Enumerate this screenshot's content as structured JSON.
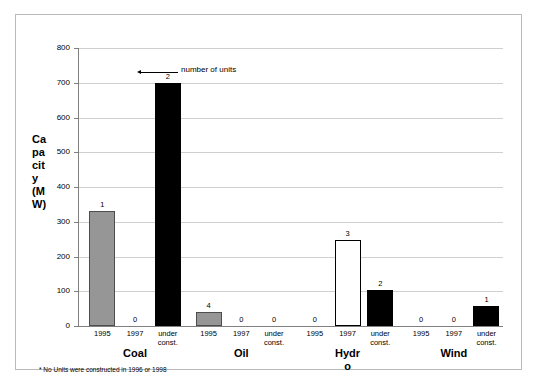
{
  "chart_data": {
    "type": "bar",
    "title": "",
    "xlabel": "",
    "ylabel": "Capacity (MW)",
    "ylim": [
      0,
      800
    ],
    "yticks": [
      0,
      100,
      200,
      300,
      400,
      500,
      600,
      700,
      800
    ],
    "ytick_labels": [
      "0",
      "100",
      "200",
      "300",
      "400",
      "500",
      "600",
      "700",
      "800"
    ],
    "grid": true,
    "legend": "none",
    "categories": [
      "Coal",
      "Oil",
      "Hydro",
      "Wind"
    ],
    "subcategories": [
      "1995",
      "1997",
      "under const."
    ],
    "series": [
      {
        "name": "Coal",
        "bars": [
          {
            "subcategory": "1995",
            "value": 330,
            "units_label": "1",
            "style": "gray"
          },
          {
            "subcategory": "1997",
            "value": 0,
            "units_label": "0",
            "style": "zero"
          },
          {
            "subcategory": "under const.",
            "value": 700,
            "units_label": "2",
            "style": "black"
          }
        ]
      },
      {
        "name": "Oil",
        "bars": [
          {
            "subcategory": "1995",
            "value": 40,
            "units_label": "4",
            "style": "gray"
          },
          {
            "subcategory": "1997",
            "value": 0,
            "units_label": "0",
            "style": "zero"
          },
          {
            "subcategory": "under const.",
            "value": 0,
            "units_label": "0",
            "style": "zero"
          }
        ]
      },
      {
        "name": "Hydro",
        "bars": [
          {
            "subcategory": "1995",
            "value": 0,
            "units_label": "0",
            "style": "zero"
          },
          {
            "subcategory": "1997",
            "value": 247,
            "units_label": "3",
            "style": "white"
          },
          {
            "subcategory": "under const.",
            "value": 105,
            "units_label": "2",
            "style": "black"
          }
        ]
      },
      {
        "name": "Wind",
        "bars": [
          {
            "subcategory": "1995",
            "value": 0,
            "units_label": "0",
            "style": "zero"
          },
          {
            "subcategory": "1997",
            "value": 0,
            "units_label": "0",
            "style": "zero"
          },
          {
            "subcategory": "under const.",
            "value": 57,
            "units_label": "1",
            "style": "black"
          }
        ]
      }
    ],
    "annotations": [
      {
        "text": "number of units",
        "points_to": "Coal / under const. data label '2'"
      }
    ],
    "footnote": "* No Units were constructed in 1996 or 1998",
    "colors": {
      "gray_bar": "#969696",
      "black_bar": "#000000",
      "white_bar": "#ffffff",
      "gridline": "#cfcfcf",
      "axis": "#808080",
      "frame": "#b9b9b9",
      "background": "#ffffff",
      "text": "#000000"
    }
  },
  "axis": {
    "y_title_chars": [
      "Ca",
      "pa",
      "cit",
      "y",
      "(M",
      "W)"
    ]
  },
  "group_label_lines": {
    "Coal": [
      "Coal"
    ],
    "Oil": [
      "Oil"
    ],
    "Hydro": [
      "Hydr",
      "o"
    ],
    "Wind": [
      "Wind"
    ]
  },
  "subcategory_lines": {
    "1995": [
      "1995"
    ],
    "1997": [
      "1997"
    ],
    "under const.": [
      "under",
      "const."
    ]
  }
}
